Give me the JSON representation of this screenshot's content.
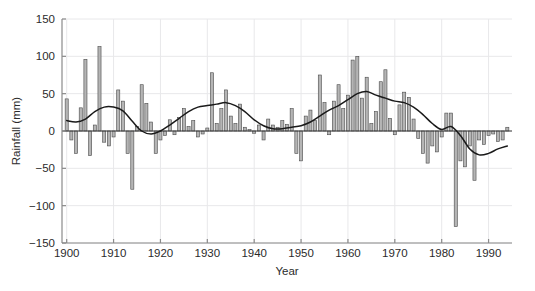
{
  "chart_data": {
    "type": "bar",
    "title": "",
    "subtitle": "",
    "xlabel": "Year",
    "ylabel": "Rainfall (mm)",
    "xlim": [
      1899,
      1995
    ],
    "ylim": [
      -150,
      150
    ],
    "xticks": [
      1900,
      1910,
      1920,
      1930,
      1940,
      1950,
      1960,
      1970,
      1980,
      1990
    ],
    "xticklabels": [
      "1900",
      "1910",
      "1920",
      "1930",
      "1940",
      "1950",
      "1960",
      "1970",
      "1980",
      "1990"
    ],
    "yticks": [
      -150,
      -100,
      -50,
      0,
      50,
      100,
      150
    ],
    "yticklabels": [
      "−150",
      "−100",
      "−50",
      "0",
      "50",
      "100",
      "150"
    ],
    "grid": true,
    "grid_color": "#e8e8ea",
    "bar_fill": "#b5b5b5",
    "bar_edge": "#4a4a4a",
    "line_color": "#1a1a1a",
    "axis_color": "#8a8a8a",
    "legend": null,
    "legend_position": "none",
    "x": [
      1900,
      1901,
      1902,
      1903,
      1904,
      1905,
      1906,
      1907,
      1908,
      1909,
      1910,
      1911,
      1912,
      1913,
      1914,
      1915,
      1916,
      1917,
      1918,
      1919,
      1920,
      1921,
      1922,
      1923,
      1924,
      1925,
      1926,
      1927,
      1928,
      1929,
      1930,
      1931,
      1932,
      1933,
      1934,
      1935,
      1936,
      1937,
      1938,
      1939,
      1940,
      1941,
      1942,
      1943,
      1944,
      1945,
      1946,
      1947,
      1948,
      1949,
      1950,
      1951,
      1952,
      1953,
      1954,
      1955,
      1956,
      1957,
      1958,
      1959,
      1960,
      1961,
      1962,
      1963,
      1964,
      1965,
      1966,
      1967,
      1968,
      1969,
      1970,
      1971,
      1972,
      1973,
      1974,
      1975,
      1976,
      1977,
      1978,
      1979,
      1980,
      1981,
      1982,
      1983,
      1984,
      1985,
      1986,
      1987,
      1988,
      1989,
      1990,
      1991,
      1992,
      1993,
      1994
    ],
    "series": [
      {
        "name": "Rainfall anomaly",
        "type": "bar",
        "values": [
          43,
          -12,
          -30,
          31,
          96,
          -33,
          8,
          113,
          -15,
          -20,
          -8,
          55,
          40,
          -30,
          -78,
          6,
          62,
          37,
          12,
          -30,
          -12,
          -6,
          15,
          -5,
          18,
          30,
          6,
          14,
          -8,
          -4,
          4,
          78,
          10,
          30,
          55,
          20,
          10,
          36,
          5,
          2,
          -3,
          8,
          -12,
          16,
          8,
          5,
          14,
          9,
          30,
          -30,
          -40,
          20,
          28,
          14,
          75,
          38,
          -5,
          40,
          62,
          30,
          48,
          95,
          100,
          44,
          72,
          10,
          26,
          66,
          82,
          17,
          -5,
          35,
          52,
          45,
          16,
          -10,
          -30,
          -43,
          -20,
          -28,
          -8,
          24,
          24,
          -128,
          -40,
          -48,
          -20,
          -66,
          -12,
          -18,
          -6,
          -4,
          -14,
          -12,
          5
        ]
      },
      {
        "name": "Smoothed trend",
        "type": "line",
        "x": [
          1900,
          1902,
          1904,
          1906,
          1908,
          1910,
          1912,
          1914,
          1916,
          1918,
          1920,
          1922,
          1924,
          1926,
          1928,
          1930,
          1932,
          1934,
          1936,
          1938,
          1940,
          1942,
          1944,
          1946,
          1948,
          1950,
          1952,
          1954,
          1956,
          1958,
          1960,
          1962,
          1964,
          1966,
          1968,
          1970,
          1972,
          1974,
          1976,
          1978,
          1980,
          1982,
          1984,
          1986,
          1988,
          1990,
          1992,
          1994
        ],
        "values": [
          14,
          12,
          16,
          26,
          32,
          32,
          27,
          13,
          0,
          -4,
          0,
          8,
          17,
          26,
          32,
          34,
          36,
          38,
          34,
          26,
          15,
          7,
          3,
          3,
          5,
          7,
          12,
          20,
          28,
          34,
          42,
          50,
          53,
          48,
          44,
          40,
          38,
          32,
          22,
          10,
          2,
          6,
          -6,
          -24,
          -32,
          -30,
          -24,
          -20
        ]
      }
    ]
  },
  "axes": {
    "xlabel": "Year",
    "ylabel": "Rainfall (mm)"
  }
}
